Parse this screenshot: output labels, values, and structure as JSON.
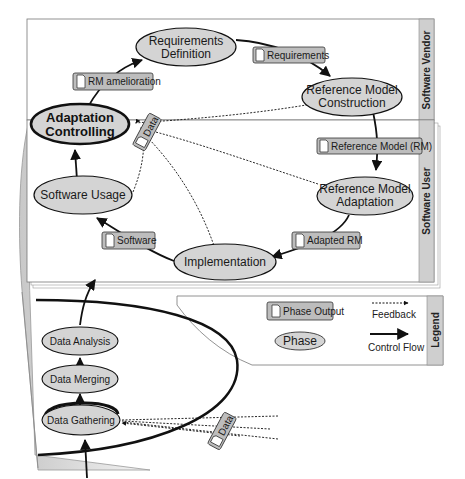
{
  "lanes": {
    "vendor": "Software Vendor",
    "user": "Software User",
    "legend": "Legend"
  },
  "phases": {
    "requirements_definition": [
      "Requirements",
      "Definition"
    ],
    "reference_model_construction": [
      "Reference Model",
      "Construction"
    ],
    "adaptation_controlling": [
      "Adaptation",
      "Controlling"
    ],
    "software_usage": "Software Usage",
    "reference_model_adaptation": [
      "Reference Model",
      "Adaptation"
    ],
    "implementation": "Implementation",
    "data_analysis": "Data Analysis",
    "data_merging": "Data Merging",
    "data_gathering": "Data Gathering"
  },
  "outputs": {
    "rm_amelioration": "RM amelioration",
    "requirements": "Requirements",
    "reference_model": "Reference Model (RM)",
    "adapted_rm": "Adapted RM",
    "software": "Software",
    "data_upper": "Data",
    "data_lower": "Data"
  },
  "legend": {
    "phase_output": "Phase Output",
    "phase": "Phase",
    "feedback": "Feedback",
    "control_flow": "Control Flow"
  },
  "colors": {
    "node_fill": "#d4d4d4",
    "output_fill": "#bdbdbd",
    "tab_fill": "#cfcfcf",
    "stroke": "#111111"
  }
}
